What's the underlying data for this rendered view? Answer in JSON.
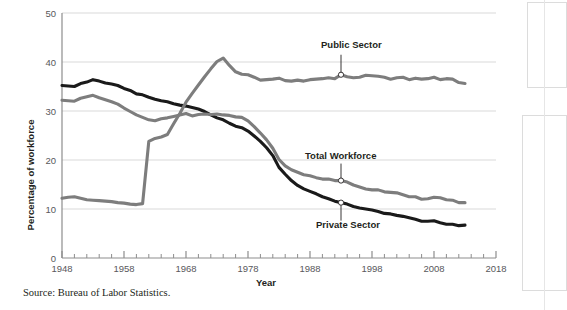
{
  "figure": {
    "source_note": "Source: Bureau of Labor Statistics."
  },
  "chart_data": {
    "type": "line",
    "title": "",
    "xlabel": "Year",
    "ylabel": "Percentage of workforce",
    "xlim": [
      1948,
      2018
    ],
    "ylim": [
      0,
      50
    ],
    "xticks": [
      1948,
      1958,
      1968,
      1978,
      1988,
      1998,
      2008,
      2018
    ],
    "yticks": [
      0,
      10,
      20,
      30,
      40,
      50
    ],
    "xtick_labels": [
      "1948",
      "1958",
      "1968",
      "1978",
      "1988",
      "1998",
      "2008",
      "2018"
    ],
    "ytick_labels": [
      "0",
      "10",
      "20",
      "30",
      "40",
      "50"
    ],
    "minor_xtick_interval": 2,
    "grid": "horizontal",
    "legend": "inline-annotations",
    "annotations": [
      {
        "text": "Public Sector",
        "series": "Public Sector",
        "point_year": 1993,
        "point_value": 37.4
      },
      {
        "text": "Total Workforce",
        "series": "Total Workforce",
        "point_year": 1993,
        "point_value": 15.8
      },
      {
        "text": "Private Sector",
        "series": "Private Sector",
        "point_year": 1993,
        "point_value": 11.3
      }
    ],
    "series": [
      {
        "name": "Private Sector",
        "color": "#1a1a1a",
        "x": [
          1948,
          1949,
          1950,
          1951,
          1952,
          1953,
          1954,
          1955,
          1956,
          1957,
          1958,
          1959,
          1960,
          1961,
          1962,
          1963,
          1964,
          1965,
          1966,
          1967,
          1968,
          1969,
          1970,
          1971,
          1972,
          1973,
          1974,
          1975,
          1976,
          1977,
          1978,
          1979,
          1980,
          1981,
          1982,
          1983,
          1984,
          1985,
          1986,
          1987,
          1988,
          1989,
          1990,
          1991,
          1992,
          1993,
          1994,
          1995,
          1996,
          1997,
          1998,
          1999,
          2000,
          2001,
          2002,
          2003,
          2004,
          2005,
          2006,
          2007,
          2008,
          2009,
          2010,
          2011,
          2012,
          2013
        ],
        "values": [
          35.2,
          35.1,
          35.0,
          35.6,
          35.9,
          36.4,
          36.1,
          35.7,
          35.5,
          35.2,
          34.6,
          34.2,
          33.5,
          33.3,
          32.8,
          32.4,
          32.1,
          31.9,
          31.5,
          31.2,
          31.0,
          30.7,
          30.4,
          29.9,
          29.2,
          28.6,
          28.2,
          27.5,
          26.9,
          26.6,
          25.9,
          24.9,
          23.8,
          22.5,
          20.9,
          18.5,
          17.1,
          15.8,
          14.8,
          14.1,
          13.6,
          13.1,
          12.5,
          12.1,
          11.6,
          11.3,
          11.0,
          10.5,
          10.2,
          10.0,
          9.8,
          9.5,
          9.1,
          9.0,
          8.7,
          8.5,
          8.2,
          7.9,
          7.5,
          7.5,
          7.6,
          7.2,
          6.9,
          6.9,
          6.6,
          6.7
        ],
        "end_year": 2013
      },
      {
        "name": "Total Workforce",
        "color": "#7d7d7d",
        "x": [
          1948,
          1949,
          1950,
          1951,
          1952,
          1953,
          1954,
          1955,
          1956,
          1957,
          1958,
          1959,
          1960,
          1961,
          1962,
          1963,
          1964,
          1965,
          1966,
          1967,
          1968,
          1969,
          1970,
          1971,
          1972,
          1973,
          1974,
          1975,
          1976,
          1977,
          1978,
          1979,
          1980,
          1981,
          1982,
          1983,
          1984,
          1985,
          1986,
          1987,
          1988,
          1989,
          1990,
          1991,
          1992,
          1993,
          1994,
          1995,
          1996,
          1997,
          1998,
          1999,
          2000,
          2001,
          2002,
          2003,
          2004,
          2005,
          2006,
          2007,
          2008,
          2009,
          2010,
          2011,
          2012,
          2013
        ],
        "values": [
          32.2,
          32.1,
          32.0,
          32.6,
          32.9,
          33.2,
          32.7,
          32.3,
          31.9,
          31.4,
          30.6,
          29.9,
          29.2,
          28.7,
          28.2,
          28.0,
          28.4,
          28.6,
          28.9,
          29.2,
          29.5,
          29.0,
          29.3,
          29.4,
          29.3,
          29.4,
          29.2,
          29.1,
          28.8,
          28.7,
          28.0,
          26.8,
          25.5,
          24.1,
          22.4,
          20.1,
          18.8,
          18.0,
          17.5,
          17.0,
          16.8,
          16.4,
          16.1,
          16.1,
          15.8,
          15.8,
          15.5,
          14.9,
          14.5,
          14.1,
          13.9,
          13.9,
          13.5,
          13.4,
          13.3,
          12.9,
          12.5,
          12.5,
          12.0,
          12.1,
          12.4,
          12.3,
          11.9,
          11.8,
          11.3,
          11.3
        ],
        "end_year": 2013
      },
      {
        "name": "Public Sector",
        "color": "#7d7d7d",
        "x": [
          1948,
          1949,
          1950,
          1951,
          1952,
          1953,
          1954,
          1955,
          1956,
          1957,
          1958,
          1959,
          1960,
          1961,
          1962,
          1963,
          1964,
          1965,
          1966,
          1967,
          1968,
          1969,
          1970,
          1971,
          1972,
          1973,
          1974,
          1975,
          1976,
          1977,
          1978,
          1979,
          1980,
          1981,
          1982,
          1983,
          1984,
          1985,
          1986,
          1987,
          1988,
          1989,
          1990,
          1991,
          1992,
          1993,
          1994,
          1995,
          1996,
          1997,
          1998,
          1999,
          2000,
          2001,
          2002,
          2003,
          2004,
          2005,
          2006,
          2007,
          2008,
          2009,
          2010,
          2011,
          2012,
          2013
        ],
        "values": [
          12.2,
          12.4,
          12.5,
          12.2,
          11.9,
          11.8,
          11.7,
          11.6,
          11.5,
          11.3,
          11.2,
          11.0,
          10.9,
          11.1,
          23.8,
          24.4,
          24.7,
          25.2,
          27.4,
          29.5,
          31.8,
          33.6,
          35.3,
          37.0,
          38.6,
          40.1,
          40.8,
          39.3,
          38.0,
          37.5,
          37.4,
          36.9,
          36.3,
          36.4,
          36.5,
          36.7,
          36.2,
          36.1,
          36.3,
          36.1,
          36.4,
          36.5,
          36.6,
          36.8,
          36.6,
          37.4,
          37.0,
          36.8,
          36.9,
          37.3,
          37.2,
          37.1,
          36.9,
          36.5,
          36.8,
          36.9,
          36.4,
          36.7,
          36.5,
          36.6,
          36.9,
          36.4,
          36.6,
          36.5,
          35.8,
          35.6
        ],
        "end_year": 2013
      }
    ]
  }
}
